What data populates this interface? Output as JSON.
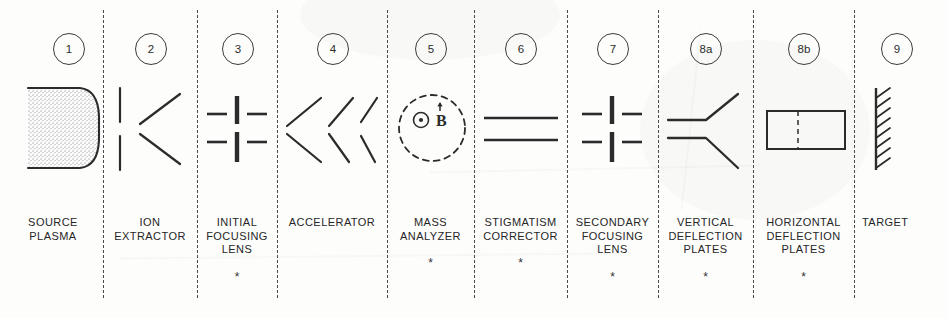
{
  "diagram": {
    "star_marker": "*",
    "line_color": "#2b2b2b",
    "paper_color": "#fdfdfc",
    "columns": [
      {
        "number": "1",
        "label": "SOURCE\nPLASMA",
        "has_star": false,
        "symbol": "plasma-stipple-block",
        "center_x": 68,
        "divider_x": 103
      },
      {
        "number": "2",
        "label": "ION\nEXTRACTOR",
        "has_star": false,
        "symbol": "extractor-bars-and-diverging-lines",
        "center_x": 150,
        "divider_x": 197
      },
      {
        "number": "3",
        "label": "INITIAL\nFOCUSING\nLENS",
        "has_star": true,
        "symbol": "quadrupole-lens-cross-bars",
        "center_x": 237,
        "divider_x": 277
      },
      {
        "number": "4",
        "label": "ACCELERATOR",
        "has_star": false,
        "symbol": "accelerator-slanted-line-pairs",
        "center_x": 332,
        "divider_x": 387
      },
      {
        "number": "5",
        "label": "MASS\nANALYZER",
        "has_star": true,
        "symbol": "dashed-circle-b-field-out-of-page",
        "center_x": 430,
        "divider_x": 474,
        "field_symbol": "⊙",
        "field_label": "B"
      },
      {
        "number": "6",
        "label": "STIGMATISM\nCORRECTOR",
        "has_star": true,
        "symbol": "two-parallel-horizontal-plates",
        "center_x": 520,
        "divider_x": 567
      },
      {
        "number": "7",
        "label": "SECONDARY\nFOCUSING\nLENS",
        "has_star": true,
        "symbol": "quadrupole-lens-cross-bars",
        "center_x": 612,
        "divider_x": 658
      },
      {
        "number": "8a",
        "label": "VERTICAL\nDEFLECTION\nPLATES",
        "has_star": true,
        "symbol": "flared-deflection-plates",
        "center_x": 705,
        "divider_x": 753
      },
      {
        "number": "8b",
        "label": "HORIZONTAL\nDEFLECTION\nPLATES",
        "has_star": true,
        "symbol": "rectangle-with-dashed-centerline",
        "center_x": 803,
        "divider_x": 854
      },
      {
        "number": "9",
        "label": "TARGET",
        "has_star": false,
        "symbol": "hatched-target-wall",
        "center_x": 896,
        "divider_x": null
      }
    ]
  }
}
